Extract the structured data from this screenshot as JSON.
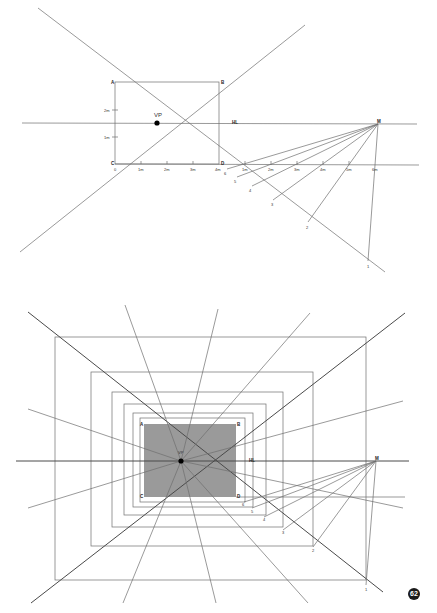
{
  "figure_number": "62",
  "top_diagram": {
    "vanishing_point_label": "VP",
    "horizon_label": "HL",
    "measuring_point_label": "M",
    "corners": {
      "A": "A",
      "B": "B",
      "C": "C",
      "D": "D"
    },
    "left_height_ticks": [
      "1m",
      "2m"
    ],
    "ground_ticks_front": [
      "0",
      "1m",
      "2m",
      "3m",
      "4m"
    ],
    "ground_ticks_right": [
      "1m",
      "2m",
      "3m",
      "4m",
      "5m",
      "6m"
    ],
    "depth_points": [
      "6",
      "5",
      "4",
      "3",
      "2",
      "1"
    ]
  },
  "bottom_diagram": {
    "vanishing_point_label": "VP",
    "horizon_label": "HL",
    "measuring_point_label": "M",
    "corners": {
      "A": "A",
      "B": "B",
      "C": "C",
      "D": "D"
    },
    "depth_points": [
      "6",
      "5",
      "4",
      "3",
      "2",
      "1"
    ],
    "shaded_color": "#9a9a9a"
  }
}
